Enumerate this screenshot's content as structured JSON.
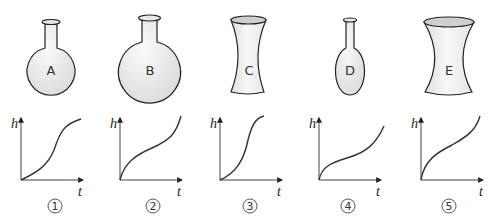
{
  "vessels": [
    {
      "label": "A",
      "shape": "round-bottom flask, medium bulb"
    },
    {
      "label": "B",
      "shape": "round-bottom flask, large bulb"
    },
    {
      "label": "C",
      "shape": "narrow hourglass (concave sides)"
    },
    {
      "label": "D",
      "shape": "oval flask with long narrow neck"
    },
    {
      "label": "E",
      "shape": "wide hourglass (concave sides)"
    }
  ],
  "graphs": [
    {
      "number": "①",
      "y_axis": "h",
      "x_axis": "t",
      "curve": "slow-then-fast-then-slow (S-curve, flattening at top)"
    },
    {
      "number": "②",
      "y_axis": "h",
      "x_axis": "t",
      "curve": "fast-then-slow-then-fast (inverse S)"
    },
    {
      "number": "③",
      "y_axis": "h",
      "x_axis": "t",
      "curve": "slow-then-fast-then-slow (steep S)"
    },
    {
      "number": "④",
      "y_axis": "h",
      "x_axis": "t",
      "curve": "fast-then-slow-then-fast (inverse S, flatter middle)"
    },
    {
      "number": "⑤",
      "y_axis": "h",
      "x_axis": "t",
      "curve": "fast-then-slow-then-fast (inverse S)"
    }
  ],
  "colors": {
    "stroke": "#222222",
    "fill_light": "#f2f2f2",
    "fill_dark": "#d9d9d9",
    "curve": "#333333"
  }
}
